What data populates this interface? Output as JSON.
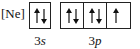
{
  "diagram": {
    "type": "orbital-box-diagram",
    "core": "[Ne]",
    "subshells": [
      {
        "name": "3s",
        "number": "3",
        "letter": "s",
        "orbitals": [
          {
            "electrons": [
              "up",
              "down"
            ]
          }
        ]
      },
      {
        "name": "3p",
        "number": "3",
        "letter": "p",
        "orbitals": [
          {
            "electrons": [
              "up",
              "down"
            ]
          },
          {
            "electrons": [
              "up",
              "down"
            ]
          },
          {
            "electrons": [
              "up"
            ]
          }
        ]
      }
    ]
  }
}
